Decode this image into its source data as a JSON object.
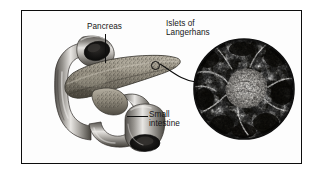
{
  "figure": {
    "kind": "anatomical-illustration",
    "frame_color": "#0d0d0d",
    "background_color": "#ffffff"
  },
  "labels": {
    "pancreas": "Pancreas",
    "islets": "Islets of\nLangerhans",
    "small_intestine": "Small\nintestine"
  },
  "structures": {
    "duodenum": {
      "name": "small-intestine-duodenum",
      "description": "C-shaped grey tube looping around the pancreas head",
      "fill_light": "#e3e1de",
      "fill_mid": "#a9a6a1",
      "fill_dark": "#4a4744",
      "lumen_color": "#1a1918"
    },
    "pancreas": {
      "name": "pancreas-body",
      "description": "Elongated stippled wedge-shaped gland tapering to a tail",
      "fill_light": "#b9b3a6",
      "fill_mid": "#8d877a",
      "fill_dark": "#4c4840",
      "stipple_color": "#32302b"
    },
    "islet_marker": {
      "name": "islet-location-marker",
      "description": "Small outlined circle on the pancreatic tail indicating the magnified region",
      "stroke_color": "#0a0a0a"
    },
    "micrograph": {
      "name": "islets-of-langerhans-micrograph",
      "description": "Circular black-and-white histology micrograph with a pale islet cluster at centre surrounded by dark acinar tissue",
      "border_color": "#111111",
      "tissue_dark": "#141414",
      "tissue_light": "#f2f2f2",
      "islet_center": "#e8e6e2"
    }
  },
  "leader_lines": {
    "pancreas_leader": "vertical line from Pancreas label down to the gland",
    "small_intestine_leader": "horizontal line from Small intestine label left to the bowel",
    "islet_pointer": "curved line from the islet marker to the micrograph circle"
  }
}
